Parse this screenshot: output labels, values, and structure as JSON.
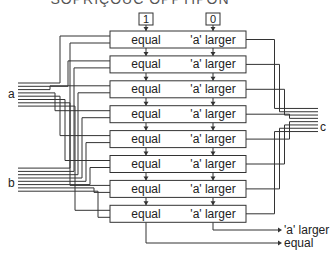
{
  "title_visible_text": "SOPRIÇOUC OPPTIPON",
  "inputs_top": [
    "1",
    "0"
  ],
  "stage_labels": {
    "left": "equal",
    "right": "'a' larger"
  },
  "stages": 8,
  "bus_labels": {
    "a": "a",
    "b": "b",
    "c": "c"
  },
  "outputs": {
    "a_larger": "'a' larger",
    "equal": "equal"
  },
  "colors": {
    "line": "#333333",
    "box_fill": "#ffffff",
    "text": "#222222"
  }
}
